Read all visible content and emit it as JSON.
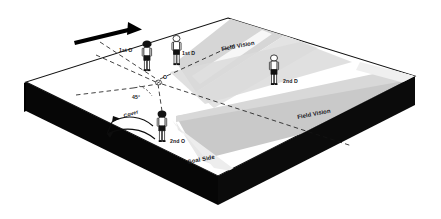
{
  "diagram": {
    "surface": {
      "top_color": "#ffffff",
      "edge_color": "#000000",
      "shadow_color": "#0a0a0a",
      "cone_color_light": "#d9d9d9",
      "cone_color_mid": "#c9c9c9",
      "cone_color_pale": "#ececec"
    },
    "labels": {
      "first_attacker": "1st O",
      "first_defender": "1st D",
      "second_defender": "2nd D",
      "second_attacker": "2nd O",
      "ball": "O",
      "angle": "45°",
      "cover": "Cover",
      "goal_side": "Goal Side",
      "field_vision_top": "Field Vision",
      "field_vision_right": "Field Vision"
    },
    "markers": {
      "direction_arrow": "run-direction-arrow",
      "cover_arrow": "cover-movement-arrow",
      "ball_icon": "ball-icon"
    },
    "players": [
      {
        "id": "player-1st-o",
        "label": "1st O",
        "role": "attacker",
        "shirt": "#ffffff",
        "shorts": "#161616",
        "head": "#161616"
      },
      {
        "id": "player-1st-d",
        "label": "1st D",
        "role": "defender",
        "shirt": "#ffffff",
        "shorts": "#161616",
        "head": "#ffffff"
      },
      {
        "id": "player-2nd-d",
        "label": "2nd D",
        "role": "defender",
        "shirt": "#ffffff",
        "shorts": "#161616",
        "head": "#ffffff"
      },
      {
        "id": "player-2nd-o",
        "label": "2nd O",
        "role": "attacker",
        "shirt": "#ffffff",
        "shorts": "#161616",
        "head": "#161616"
      }
    ]
  }
}
